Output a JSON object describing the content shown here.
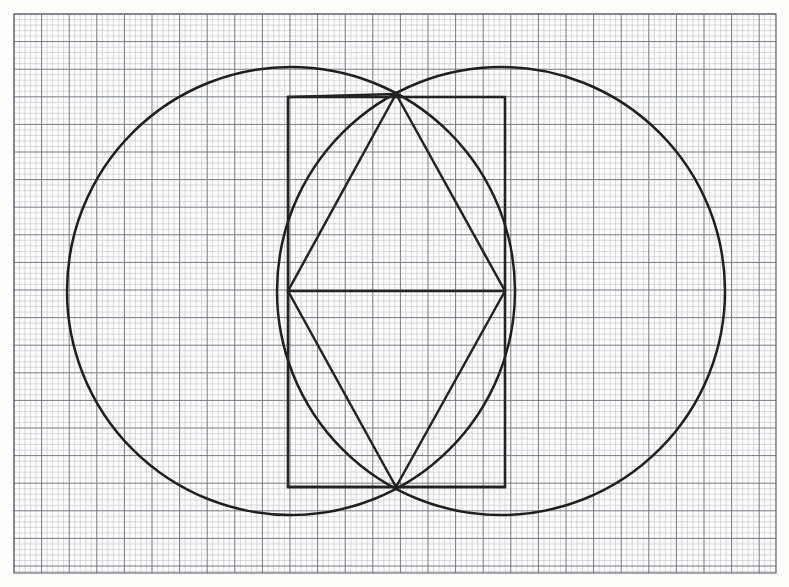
{
  "document": {
    "title": "Geometric construction on graph paper",
    "description": "Hand-drawn compass-and-straightedge figure: two overlapping circles (vesica piscis) with an inscribed rectangle, a rhombus/hexagon and chords, drawn in dark ink on pale blue-grey quadrille graph paper.",
    "medium": "ink on graph paper",
    "background_color": "#fdfdfc",
    "ink_color": "#201f1e"
  },
  "canvas": {
    "width": 789,
    "height": 587
  },
  "paper": {
    "name": "quadrille-graph-paper",
    "minor_spacing_px": 5.52,
    "major_every_n_minor": 5,
    "minor_color": "#b9bcc4",
    "major_color": "#6f737d",
    "border_color": "#5c6069",
    "area": {
      "x": 14,
      "y": 14,
      "width": 762,
      "height": 559
    },
    "minor_columns": 138,
    "minor_rows": 101
  },
  "chart_data": {
    "type": "scatter",
    "xlabel": "",
    "ylabel": "",
    "grid": true,
    "legend_position": "none",
    "xlim": [
      0,
      789
    ],
    "ylim": [
      587,
      0
    ],
    "annotations": [
      "two equal circles of radius 224 px whose centres are 210 px apart",
      "each circle passes near the centre region of the other forming a vesica",
      "rectangle spans the two lens intersection points vertically",
      "rhombus/hexagon joins lens apexes to the rectangle mid-side points"
    ],
    "shapes": [
      {
        "name": "left-circle",
        "kind": "circle",
        "cx": 291,
        "cy": 291,
        "r": 224,
        "stroke": "#201f1e",
        "stroke_width": 2.5,
        "fill": "none"
      },
      {
        "name": "right-circle",
        "kind": "circle",
        "cx": 501,
        "cy": 291,
        "r": 224,
        "stroke": "#201f1e",
        "stroke_width": 2.5,
        "fill": "none"
      },
      {
        "name": "inscribed-rectangle",
        "kind": "rect",
        "x": 288,
        "y": 97,
        "width": 217,
        "height": 390,
        "stroke": "#242322",
        "stroke_width": 2.6,
        "fill": "none"
      },
      {
        "name": "horizontal-chord",
        "kind": "line",
        "x1": 288,
        "y1": 291,
        "x2": 505,
        "y2": 291,
        "stroke": "#242322",
        "stroke_width": 2.5
      },
      {
        "name": "upper-left-diagonal",
        "kind": "line",
        "x1": 288,
        "y1": 291,
        "x2": 396,
        "y2": 94,
        "stroke": "#242322",
        "stroke_width": 2.5
      },
      {
        "name": "upper-right-diagonal",
        "kind": "line",
        "x1": 505,
        "y1": 291,
        "x2": 396,
        "y2": 94,
        "stroke": "#242322",
        "stroke_width": 2.5
      },
      {
        "name": "lower-left-diagonal",
        "kind": "line",
        "x1": 288,
        "y1": 291,
        "x2": 396,
        "y2": 487,
        "stroke": "#242322",
        "stroke_width": 2.5
      },
      {
        "name": "lower-right-diagonal",
        "kind": "line",
        "x1": 505,
        "y1": 291,
        "x2": 396,
        "y2": 487,
        "stroke": "#242322",
        "stroke_width": 2.5
      },
      {
        "name": "apex-to-rect-top-left",
        "kind": "line",
        "x1": 396,
        "y1": 94,
        "x2": 288,
        "y2": 97,
        "stroke": "#242322",
        "stroke_width": 2.5
      },
      {
        "name": "apex-to-rect-bottom-right",
        "kind": "line",
        "x1": 396,
        "y1": 487,
        "x2": 505,
        "y2": 487,
        "stroke": "#242322",
        "stroke_width": 2.5
      },
      {
        "name": "apex-to-rect-bottom-left",
        "kind": "line",
        "x1": 396,
        "y1": 487,
        "x2": 288,
        "y2": 487,
        "stroke": "#242322",
        "stroke_width": 2.5
      }
    ],
    "key_points": [
      {
        "name": "upper-intersection",
        "x": 396,
        "y": 94
      },
      {
        "name": "lower-intersection",
        "x": 396,
        "y": 487
      },
      {
        "name": "left-midpoint",
        "x": 288,
        "y": 291
      },
      {
        "name": "right-midpoint",
        "x": 505,
        "y": 291
      },
      {
        "name": "left-circle-center",
        "x": 291,
        "y": 291
      },
      {
        "name": "right-circle-center",
        "x": 501,
        "y": 291
      },
      {
        "name": "left-circle-leftmost",
        "x": 67,
        "y": 291
      },
      {
        "name": "right-circle-rightmost",
        "x": 725,
        "y": 291
      },
      {
        "name": "circles-topmost",
        "y": 67
      },
      {
        "name": "circles-bottommost",
        "y": 515
      }
    ]
  }
}
